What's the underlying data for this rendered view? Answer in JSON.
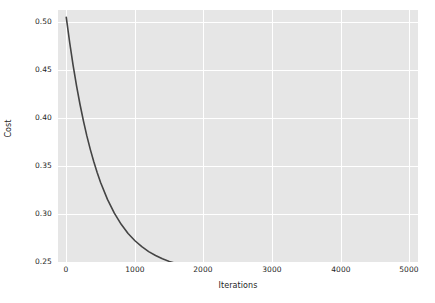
{
  "chart_data": {
    "type": "line",
    "title": "",
    "xlabel": "Iterations",
    "ylabel": "Cost",
    "xlim": [
      -120,
      5120
    ],
    "ylim": [
      0.2455,
      0.5075
    ],
    "grid": true,
    "legend": null,
    "xticks": [
      0,
      1000,
      2000,
      3000,
      4000,
      5000
    ],
    "xticklabels": [
      "0",
      "1000",
      "2000",
      "3000",
      "4000",
      "5000"
    ],
    "yticks": [
      0.25,
      0.3,
      0.35,
      0.4,
      0.45,
      0.5
    ],
    "yticklabels": [
      "0.25",
      "0.30",
      "0.35",
      "0.40",
      "0.45",
      "0.50"
    ],
    "series": [
      {
        "name": "Cost",
        "color": "#444444",
        "linewidth": 1.6,
        "x": [
          0,
          50,
          100,
          150,
          200,
          250,
          300,
          350,
          400,
          450,
          500,
          600,
          700,
          800,
          900,
          1000,
          1100,
          1200,
          1300,
          1400,
          1500,
          1600,
          1700,
          1800,
          1900,
          2000,
          2200,
          2400,
          2600,
          2800,
          3000,
          3250,
          3500,
          3750,
          4000,
          4250,
          4500,
          4750,
          5000
        ],
        "y": [
          0.5,
          0.4737,
          0.45,
          0.4287,
          0.4095,
          0.3922,
          0.3766,
          0.3626,
          0.3499,
          0.3385,
          0.3282,
          0.3106,
          0.2963,
          0.2847,
          0.2752,
          0.2676,
          0.2614,
          0.2563,
          0.2522,
          0.2489,
          0.2461,
          0.2439,
          0.2421,
          0.2406,
          0.2394,
          0.2384,
          0.2369,
          0.236,
          0.2354,
          0.235,
          0.2348,
          0.2346,
          0.2345,
          0.2344,
          0.2344,
          0.2344,
          0.2344,
          0.2344,
          0.2344
        ]
      }
    ],
    "asymptote": 0.2593,
    "start_value": 0.5
  },
  "style": {
    "figure_background": "#ffffff",
    "axes_background": "#e6e6e6",
    "grid_color": "#ffffff",
    "tick_label_color": "#262626",
    "line_color": "#444444"
  }
}
